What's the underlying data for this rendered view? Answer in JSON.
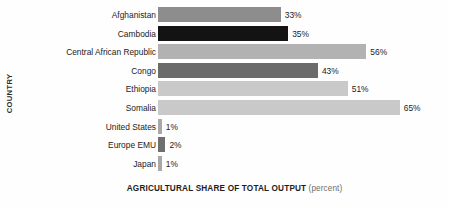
{
  "chart_data": {
    "type": "bar",
    "orientation": "horizontal",
    "title": "",
    "xlabel": "AGRICULTURAL SHARE OF TOTAL OUTPUT",
    "xlabel_unit": "(percent)",
    "ylabel": "COUNTRY",
    "grid": false,
    "legend": "none",
    "xlim": [
      0,
      70
    ],
    "value_suffix": "%",
    "categories": [
      "Afghanistan",
      "Cambodia",
      "Central African Republic",
      "Congo",
      "Ethiopia",
      "Somalia",
      "United States",
      "Europe EMU",
      "Japan"
    ],
    "values": [
      33,
      35,
      56,
      43,
      51,
      65,
      1,
      2,
      1
    ],
    "value_labels": [
      "33%",
      "35%",
      "56%",
      "43%",
      "51%",
      "65%",
      "1%",
      "2%",
      "1%"
    ],
    "bar_colors": [
      "#8d8d8d",
      "#131313",
      "#b2b2b2",
      "#6b6b6b",
      "#c9c9c9",
      "#c9c9c9",
      "#a8a8a8",
      "#6f6f6f",
      "#a8a8a8"
    ]
  }
}
